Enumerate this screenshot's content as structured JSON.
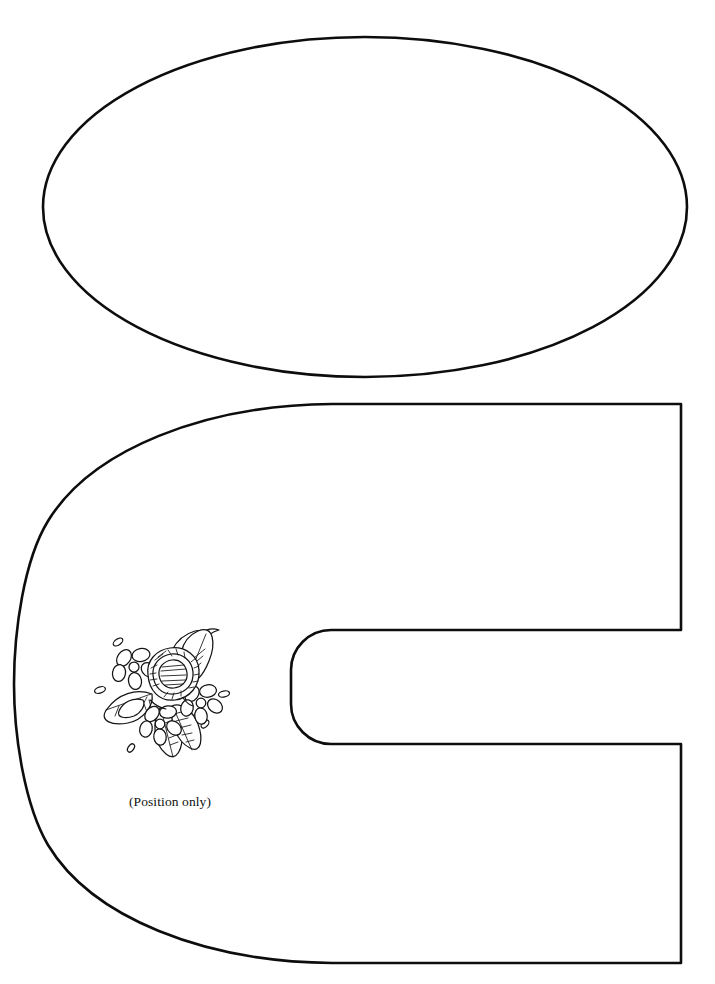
{
  "document": {
    "kind": "sewing-pattern-template",
    "background_color": "#ffffff",
    "ink_color": "#0d0d0d",
    "width": 715,
    "height": 984
  },
  "annotations": {
    "position_only_label": "(Position only)"
  },
  "pieces": [
    {
      "id": "oval-piece",
      "name": "oval-pattern-piece",
      "shape": "ellipse",
      "center_x": 365,
      "center_y": 207,
      "radius_x": 322,
      "radius_y": 170,
      "stroke_width": 2.6
    },
    {
      "id": "c-piece",
      "name": "c-shaped-pattern-piece",
      "shape": "c-horseshoe",
      "left_x": 14,
      "top_y": 404,
      "right_x": 681,
      "bottom_y": 963,
      "notch_top_y": 630,
      "notch_bottom_y": 744,
      "notch_left_x": 291,
      "notch_corner_radius": 40,
      "stroke_width": 2.6
    }
  ],
  "motif": {
    "name": "floral-embroidery-motif",
    "description": "rose with five-petal flowers, leaves and scattered seed dots",
    "center_x": 160,
    "center_y": 690,
    "elements": {
      "roses": 1,
      "flowers": 3,
      "leaves": 5,
      "seed_dots": 6
    },
    "label": "(Position only)",
    "label_x": 170,
    "label_y": 802
  }
}
